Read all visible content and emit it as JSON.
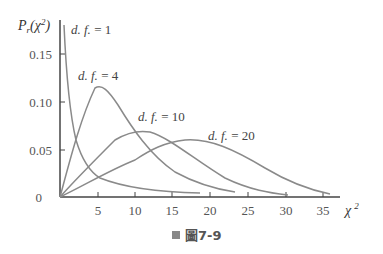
{
  "chart_data": {
    "type": "line",
    "title": "",
    "xlabel": "χ²",
    "ylabel": "Pr(χ²)",
    "xlim": [
      0,
      37
    ],
    "ylim": [
      0,
      0.18
    ],
    "x_ticks": [
      "5",
      "10",
      "15",
      "20",
      "25",
      "30",
      "35"
    ],
    "y_ticks": [
      "0",
      "0.05",
      "0.10",
      "0.15"
    ],
    "grid": false,
    "legend": "inline labels",
    "series": [
      {
        "name": "d.f.=1",
        "df": 1,
        "label": "d. f. = 1"
      },
      {
        "name": "d.f.=4",
        "df": 4,
        "label": "d. f. = 4",
        "peak": [
          2,
          0.115
        ]
      },
      {
        "name": "d.f.=10",
        "df": 10,
        "label": "d. f. = 10",
        "peak": [
          8,
          0.072
        ]
      },
      {
        "name": "d.f.=20",
        "df": 20,
        "label": "d. f. = 20",
        "peak": [
          18,
          0.063
        ]
      }
    ]
  },
  "axis": {
    "y_title_main": "P",
    "y_title_sub": "r",
    "y_title_arg": "(χ",
    "y_title_sup": "2",
    "y_title_close": ")",
    "x_title": "χ",
    "x_title_sup": "2",
    "y_ticks": [
      "0",
      "0.05",
      "0.10",
      "0.15"
    ],
    "x_ticks": [
      "5",
      "10",
      "15",
      "20",
      "25",
      "30",
      "35"
    ]
  },
  "labels": {
    "df1": "d. f. = 1",
    "df4": "d. f. = 4",
    "df10": "d. f. = 10",
    "df20": "d. f. = 20"
  },
  "caption": "圖7-9",
  "colors": {
    "curve": "#8a8a8a",
    "axis": "#444444"
  }
}
